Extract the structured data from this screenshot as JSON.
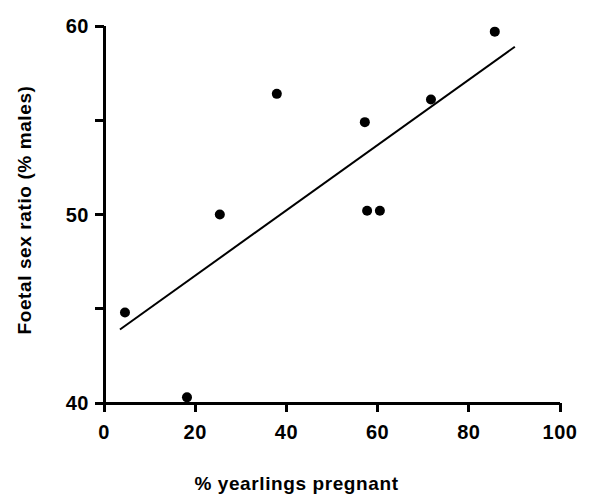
{
  "chart_data": {
    "type": "scatter",
    "title": "",
    "xlabel": "% yearlings pregnant",
    "ylabel": "Foetal sex ratio (% males)",
    "xlim": [
      0,
      100
    ],
    "ylim": [
      40,
      60
    ],
    "grid": false,
    "legend": null,
    "x_ticks": [
      {
        "value": 0,
        "label": "0",
        "major": true
      },
      {
        "value": 20,
        "label": "20",
        "major": true
      },
      {
        "value": 40,
        "label": "40",
        "major": true
      },
      {
        "value": 60,
        "label": "60",
        "major": true
      },
      {
        "value": 80,
        "label": "80",
        "major": true
      },
      {
        "value": 100,
        "label": "100",
        "major": true
      }
    ],
    "y_ticks": [
      {
        "value": 40,
        "label": "40",
        "major": true
      },
      {
        "value": 45,
        "label": "",
        "major": false
      },
      {
        "value": 50,
        "label": "50",
        "major": true
      },
      {
        "value": 55,
        "label": "",
        "major": false
      },
      {
        "value": 60,
        "label": "60",
        "major": true
      }
    ],
    "marker": {
      "shape": "circle",
      "color": "#000000",
      "radius_px": 5
    },
    "points": [
      {
        "x": 4.6,
        "y": 44.8
      },
      {
        "x": 18.2,
        "y": 40.3
      },
      {
        "x": 25.4,
        "y": 50.0
      },
      {
        "x": 37.9,
        "y": 56.4
      },
      {
        "x": 57.2,
        "y": 54.9
      },
      {
        "x": 57.7,
        "y": 50.2
      },
      {
        "x": 60.5,
        "y": 50.2
      },
      {
        "x": 71.7,
        "y": 56.1
      },
      {
        "x": 85.7,
        "y": 59.7
      }
    ],
    "trend_line": {
      "name": "regression line",
      "color": "#000000",
      "width_px": 2,
      "x_start": 3.5,
      "y_start": 43.9,
      "x_end": 90.1,
      "y_end": 58.9
    },
    "axis": {
      "color": "#000000",
      "width_px": 3,
      "tick_length_px": 9
    }
  }
}
